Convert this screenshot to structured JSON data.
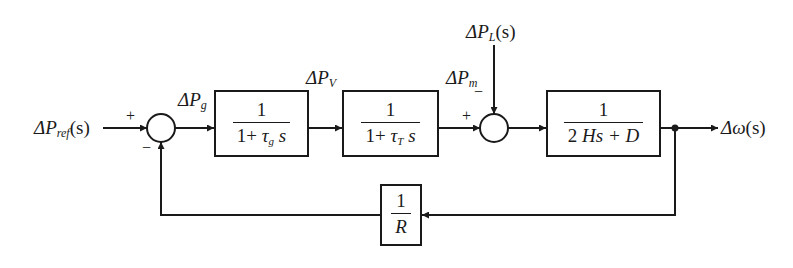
{
  "diagram": {
    "type": "block-diagram",
    "signals": {
      "input": {
        "symbol": "ΔP",
        "sub": "ref",
        "arg": "(s)"
      },
      "governor_out": {
        "symbol": "ΔP",
        "sub": "g"
      },
      "valve": {
        "symbol": "ΔP",
        "sub": "V"
      },
      "mechanical": {
        "symbol": "ΔP",
        "sub": "m"
      },
      "load": {
        "symbol": "ΔP",
        "sub": "L",
        "arg": "(s)"
      },
      "output": {
        "symbol": "Δω",
        "arg": "(s)"
      }
    },
    "junctions": [
      {
        "id": "sum1",
        "signs": {
          "input": "+",
          "feedback": "−"
        }
      },
      {
        "id": "sum2",
        "signs": {
          "mechanical": "+",
          "load": "−"
        }
      }
    ],
    "blocks": [
      {
        "id": "governor",
        "numerator": "1",
        "den_pre": "1+ ",
        "den_var": "τ",
        "den_sub": "g",
        "den_post": " s"
      },
      {
        "id": "turbine",
        "numerator": "1",
        "den_pre": "1+ ",
        "den_var": "τ",
        "den_sub": "T",
        "den_post": " s"
      },
      {
        "id": "rotating-mass",
        "numerator": "1",
        "den_pre": "2 ",
        "den_var": "Hs",
        "den_sub": "",
        "den_post": " + D"
      },
      {
        "id": "droop",
        "numerator": "1",
        "den_pre": "",
        "den_var": "R",
        "den_sub": "",
        "den_post": ""
      }
    ],
    "colors": {
      "line": "#1a1a1a",
      "background": "#ffffff"
    }
  }
}
